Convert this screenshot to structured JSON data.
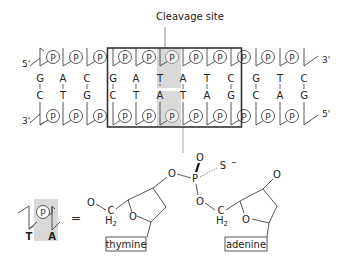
{
  "cleavage_label": "Cleavage site",
  "strand_labels": {
    "top_left": "5'",
    "top_right": "3'",
    "bottom_left": "3'",
    "bottom_right": "5'"
  },
  "phosphate_label": "P",
  "top_strand": [
    "G",
    "A",
    "C",
    "G",
    "A",
    "T",
    "A",
    "T",
    "C",
    "G",
    "T",
    "C"
  ],
  "bottom_strand": [
    "C",
    "T",
    "G",
    "C",
    "T",
    "A",
    "T",
    "A",
    "G",
    "C",
    "A",
    "G"
  ],
  "highlighted_box": {
    "start_index": 3,
    "end_index": 8
  },
  "highlighted_pair_index": [
    5,
    6
  ],
  "legend": {
    "left_base": "T",
    "right_base": "A",
    "equals": "="
  },
  "chemistry": {
    "oxygen": "O",
    "phosphorus": "P",
    "sulfur": "S",
    "charge": "–",
    "carbon": "C",
    "h2": "H",
    "h2_sub": "2",
    "nucleoside_left": "thymine",
    "nucleoside_right": "adenine"
  },
  "colors": {
    "highlight": "#d9d9d9",
    "line": "#444444",
    "box": "#333333"
  }
}
